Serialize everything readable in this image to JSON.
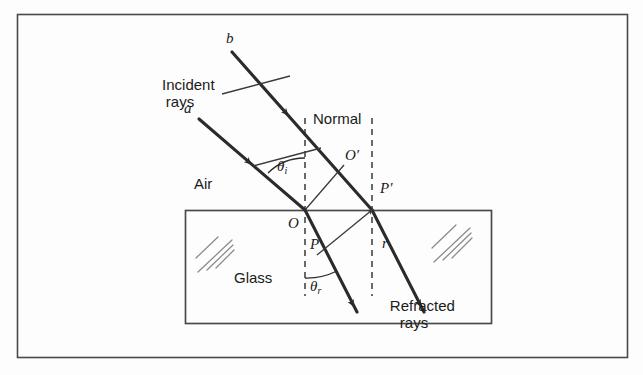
{
  "figure": {
    "frame": {
      "x": 17,
      "y": 14,
      "width": 611,
      "height": 344,
      "stroke": "#4a4a4a"
    },
    "glass_block": {
      "x": 185,
      "y": 210,
      "width": 307,
      "height": 114,
      "stroke": "#4a4a4a"
    }
  },
  "labels": {
    "incident_rays": "Incident\nrays",
    "refracted_rays": "Refracted\nrays",
    "normal": "Normal",
    "air": "Air",
    "glass": "Glass",
    "ray_a": "a",
    "ray_b": "b",
    "point_O": "O",
    "point_O_prime": "O′",
    "point_P": "P",
    "point_P_prime": "P′",
    "angle_i": "θ",
    "angle_i_sub": "i",
    "angle_r": "θ",
    "angle_r_sub": "r",
    "segment_r": "r"
  },
  "colors": {
    "ink": "#1a1a1a",
    "ray": "#2b2b2b",
    "thin": "#3a3a3a",
    "frame": "#4a4a4a",
    "background": "#fdfdfd",
    "hatch": "#8a8a8a"
  },
  "geometry": {
    "interface_y": 210,
    "point_O": [
      305,
      210
    ],
    "point_P_prime": [
      372,
      210
    ],
    "normal_left_x": 305,
    "normal_right_x": 372,
    "incident_angle_deg": 42,
    "refracted_angle_deg": 26
  },
  "icons": {
    "arrowhead": "ray-arrowhead",
    "hatch": "glass-hatch-marks",
    "dashes": "normal-dashed-line"
  }
}
